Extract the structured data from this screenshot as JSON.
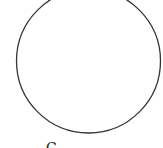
{
  "diagram": {
    "shape": "circle",
    "stroke_color": "#333333",
    "fill_color": "#ffffff",
    "caption": "C"
  }
}
